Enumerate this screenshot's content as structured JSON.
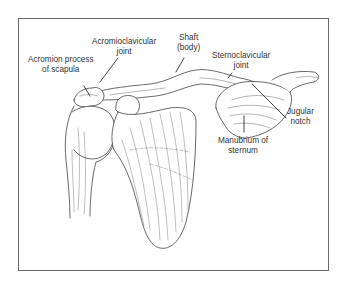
{
  "figure": {
    "frame_color": "#6b6b6b",
    "line_color": "#444444",
    "labels": [
      {
        "id": "acromion",
        "line1": "Acromion process",
        "line2": "of scapula"
      },
      {
        "id": "acromioclavicular",
        "line1": "Acromioclavicular",
        "line2": "joint"
      },
      {
        "id": "shaft",
        "line1": "Shaft",
        "line2": "(body)"
      },
      {
        "id": "sternoclavicular",
        "line1": "Sternoclavicular",
        "line2": "joint"
      },
      {
        "id": "jugular",
        "line1": "Jugular",
        "line2": "notch"
      },
      {
        "id": "manubrium",
        "line1": "Manubrium of",
        "line2": "sternum"
      }
    ]
  }
}
